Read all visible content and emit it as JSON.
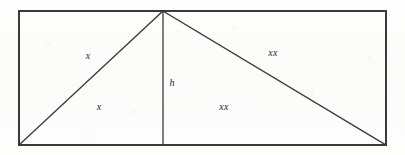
{
  "figure": {
    "kind": "geometry-diagram",
    "canvas": {
      "width": 405,
      "height": 155
    },
    "colors": {
      "background": "#fdfdfc",
      "stroke": "#3a3a3a",
      "label_text": "#2b2b2b"
    },
    "stroke_width": 1.3,
    "rectangle": {
      "name": "outer-rectangle",
      "left": 19,
      "top": 11,
      "right": 386,
      "bottom": 145,
      "corners": [
        {
          "name": "top-left",
          "x": 19,
          "y": 11
        },
        {
          "name": "top-right",
          "x": 386,
          "y": 11
        },
        {
          "name": "bottom-right",
          "x": 386,
          "y": 145
        },
        {
          "name": "bottom-left",
          "x": 19,
          "y": 145
        }
      ]
    },
    "apex": {
      "name": "triangle-apex",
      "x": 163,
      "y": 11
    },
    "segments": [
      {
        "name": "left-slant-side",
        "x1": 163,
        "y1": 11,
        "x2": 19,
        "y2": 145
      },
      {
        "name": "altitude-line",
        "x1": 163,
        "y1": 11,
        "x2": 163,
        "y2": 145
      },
      {
        "name": "right-slant-side",
        "x1": 163,
        "y1": 11,
        "x2": 386,
        "y2": 145
      }
    ],
    "labels": [
      {
        "name": "label-left-side",
        "text": "x",
        "x": 88,
        "y": 56
      },
      {
        "name": "label-left-region",
        "text": "x",
        "x": 99,
        "y": 107
      },
      {
        "name": "label-altitude",
        "text": "h",
        "x": 172,
        "y": 83
      },
      {
        "name": "label-right-side",
        "text": "xx",
        "x": 273,
        "y": 53
      },
      {
        "name": "label-right-region",
        "text": "xx",
        "x": 224,
        "y": 107
      }
    ]
  }
}
